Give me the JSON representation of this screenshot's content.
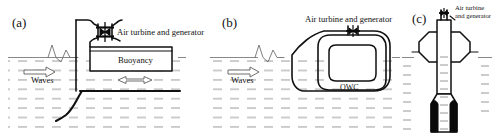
{
  "figure": {
    "background_color": "#ffffff",
    "line_color": "#111111",
    "water_color": "#8c8c8c",
    "width": 504,
    "height": 138
  },
  "panels": [
    {
      "id": "a",
      "label": "(a)",
      "type": "bottom-fixed / moored shoreline OWC with buoyancy module",
      "annotations": [
        {
          "name": "turbine-label",
          "text": "Air turbine and generator"
        },
        {
          "name": "buoyancy-label",
          "text": "Buoyancy"
        },
        {
          "name": "waves-label",
          "text": "Waves"
        }
      ],
      "symbols": [
        {
          "name": "turbine-symbol",
          "text": "bowtie-turbine"
        },
        {
          "name": "wave-direction-arrow",
          "text": "single-arrow-right"
        },
        {
          "name": "heave-motion-arrow",
          "text": "double-headed-arrow"
        },
        {
          "name": "mooring-line",
          "text": "seabed-mooring-cable"
        }
      ]
    },
    {
      "id": "b",
      "label": "(b)",
      "type": "floating OWC with tapered wave-capture nose",
      "annotations": [
        {
          "name": "turbine-label",
          "text": "Air turbine and generator"
        },
        {
          "name": "owc-label",
          "text": "OWC"
        },
        {
          "name": "waves-label",
          "text": "Waves"
        }
      ],
      "symbols": [
        {
          "name": "turbine-symbol",
          "text": "bowtie-turbine"
        },
        {
          "name": "wave-direction-arrow",
          "text": "single-arrow-right"
        }
      ]
    },
    {
      "id": "c",
      "label": "(c)",
      "type": "floating spar-buoy OWC",
      "annotations": [
        {
          "name": "turbine-label-line-1",
          "text": "Air turbine"
        },
        {
          "name": "turbine-label-line-2",
          "text": "and generator"
        }
      ],
      "symbols": [
        {
          "name": "turbine-symbol",
          "text": "bowtie-turbine"
        },
        {
          "name": "ballast-block",
          "text": "solid-black-ballast"
        }
      ]
    }
  ]
}
